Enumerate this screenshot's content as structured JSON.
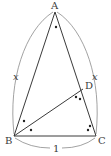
{
  "diagram": {
    "type": "geometry-triangle",
    "colors": {
      "stroke": "#3a3a3a",
      "arc": "#8a8a8a",
      "background": "#ffffff"
    },
    "points": {
      "A": {
        "label": "A",
        "x": 55,
        "y": 12
      },
      "B": {
        "label": "B",
        "x": 14,
        "y": 136
      },
      "C": {
        "label": "C",
        "x": 96,
        "y": 136
      },
      "D": {
        "label": "D",
        "x": 83,
        "y": 88
      }
    },
    "segments": [
      "AB",
      "AC",
      "BC",
      "BD"
    ],
    "side_labels": {
      "AB": "x",
      "AC": "x",
      "BC": "1"
    },
    "angle_marks": [
      {
        "vertex": "A",
        "dots": 1,
        "description": "angle BAC"
      },
      {
        "vertex": "B",
        "dots": 1,
        "description": "angle ABD (upper)"
      },
      {
        "vertex": "B",
        "dots": 1,
        "description": "angle DBC (lower)"
      },
      {
        "vertex": "C",
        "dots": 2,
        "description": "angle BCD"
      },
      {
        "vertex": "D",
        "dots": 2,
        "description": "angle BDC"
      }
    ]
  }
}
